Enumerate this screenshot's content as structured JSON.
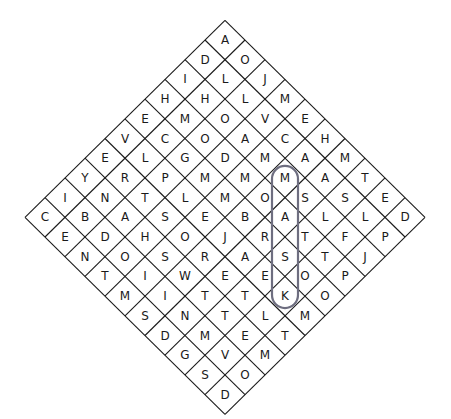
{
  "puzzle": {
    "type": "word-search",
    "shape": "diamond",
    "size": 10,
    "lines": [
      "A",
      "DO",
      "ILJ",
      "HHLM",
      "EMOVE",
      "VCOACH",
      "ELGDMAM",
      "YRPMMMAT",
      "INTLMOSSE",
      "CBASEBALLD",
      "EDHOJRTFP",
      "NOSRASTJ",
      "TIWEEOP",
      "MITTKO",
      "SNTLM",
      "DMET",
      "GVM",
      "SO",
      "D"
    ],
    "found_words": [
      {
        "word": "MASK",
        "start_line": 7,
        "start_index": 5,
        "direction": "down",
        "color": "#6e6e80"
      }
    ]
  }
}
